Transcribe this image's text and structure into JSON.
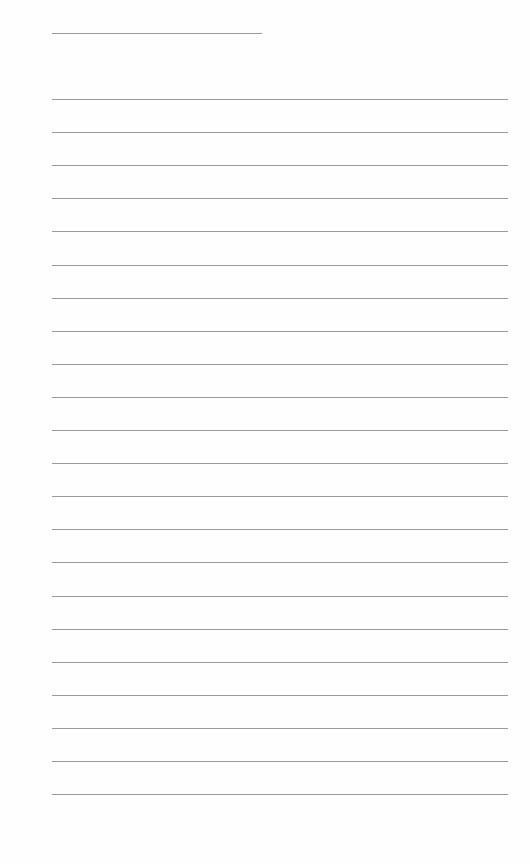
{
  "document": {
    "type": "lined-paper",
    "header_line": {
      "x": 52,
      "y": 33,
      "width": 210
    },
    "rules": {
      "count": 22,
      "start_y": 99,
      "spacing": 33.1,
      "x": 52,
      "width": 456
    },
    "line_color": "#9a9a9a",
    "background_color": "#fefefe"
  }
}
